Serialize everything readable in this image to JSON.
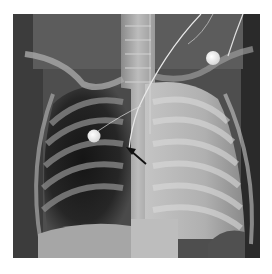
{
  "image": {
    "type": "chest radiograph",
    "view": "frontal",
    "annotations": [
      {
        "kind": "arrow",
        "color": "#111111",
        "description": "arrow pointing to catheter tip near mediastinum"
      }
    ],
    "markers": [
      {
        "kind": "ecg-electrode",
        "position": "right upper chest"
      },
      {
        "kind": "ecg-electrode",
        "position": "left shoulder"
      }
    ],
    "colors": {
      "background": "#ffffff",
      "dark_lung": "#1e1e1e",
      "opaque_lung": "#b8b8b8",
      "bone": "#d8d8d8",
      "electrode": "#f2f2f2"
    }
  }
}
